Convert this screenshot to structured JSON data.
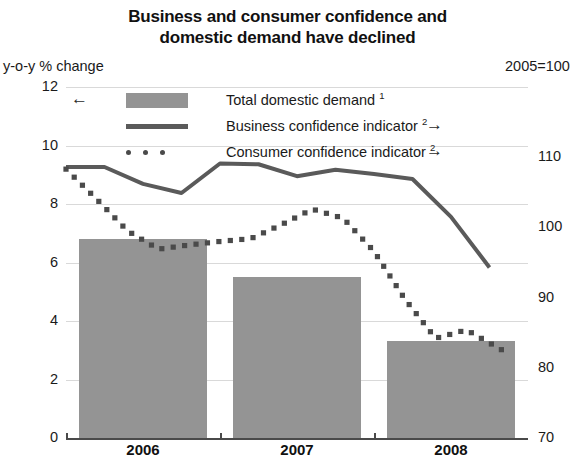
{
  "title": "Business and consumer confidence and\ndomestic demand have declined",
  "title_line1": "Business and consumer confidence and",
  "title_line2": "domestic demand have declined",
  "axis_unit_left": "y-o-y % change",
  "axis_unit_right": "2005=100",
  "legend": {
    "items": [
      {
        "label": "Total domestic demand ",
        "sup": "1",
        "marker": "filled-box",
        "color": "#949494",
        "axis_arrow": "←",
        "arrow_side": "left"
      },
      {
        "label": "Business confidence indicator ",
        "sup": "2",
        "marker": "solid-line",
        "color": "#5a5a5a",
        "axis_arrow": "→",
        "arrow_side": "right"
      },
      {
        "label": "Consumer confidence indicator ",
        "sup": "2",
        "marker": "dotted-line",
        "color": "#4a4a4a",
        "axis_arrow": "→",
        "arrow_side": "right"
      }
    ]
  },
  "chart_data": {
    "type": "bar",
    "title": "Business and consumer confidence and domestic demand have declined",
    "xlabel": "",
    "ylabel": "y-o-y % change",
    "y2label": "2005=100",
    "grid": true,
    "legend_position": "top-center",
    "categories": [
      "2006",
      "2007",
      "2008"
    ],
    "ylim": [
      0,
      12
    ],
    "yticks": [
      0,
      2,
      4,
      6,
      8,
      10,
      12
    ],
    "y2lim": [
      70,
      120
    ],
    "y2ticks": [
      70,
      80,
      90,
      100,
      110,
      120
    ],
    "y2ticklabels": [
      "70",
      "80",
      "90",
      "100",
      "110",
      "2005=100"
    ],
    "series": [
      {
        "name": "Total domestic demand",
        "type": "bar",
        "axis": "left",
        "color": "#949494",
        "footnote": "1",
        "categories": [
          "2006",
          "2007",
          "2008"
        ],
        "values": [
          6.8,
          5.5,
          3.3
        ]
      },
      {
        "name": "Business confidence indicator",
        "type": "line",
        "axis": "right",
        "color": "#5a5a5a",
        "style": "solid",
        "footnote": "2",
        "x": [
          2006.0,
          2006.25,
          2006.5,
          2006.75,
          2007.0,
          2007.25,
          2007.5,
          2007.75,
          2008.0,
          2008.25,
          2008.5,
          2008.75
        ],
        "values": [
          108.6,
          108.6,
          106.2,
          104.9,
          109.1,
          109.0,
          107.3,
          108.2,
          107.6,
          106.9,
          101.5,
          94.3
        ]
      },
      {
        "name": "Consumer confidence indicator",
        "type": "line",
        "axis": "right",
        "color": "#4a4a4a",
        "style": "dotted",
        "footnote": "2",
        "x": [
          2006.0,
          2006.2,
          2006.4,
          2006.6,
          2006.8,
          2007.0,
          2007.2,
          2007.4,
          2007.6,
          2007.8,
          2008.0,
          2008.2,
          2008.4,
          2008.6,
          2008.85
        ],
        "values": [
          108.3,
          104.0,
          99.5,
          96.9,
          97.5,
          98.0,
          98.4,
          100.4,
          102.6,
          101.3,
          96.6,
          89.8,
          84.2,
          85.4,
          82.3
        ]
      }
    ]
  }
}
